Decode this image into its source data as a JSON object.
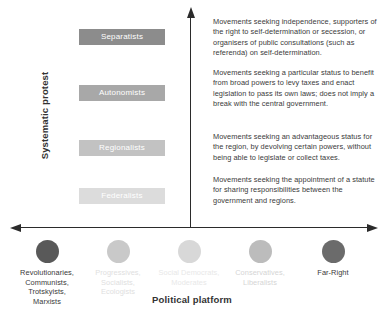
{
  "axes": {
    "y_title": "Systematic protest",
    "x_title": "Political platform"
  },
  "colors": {
    "axis": "#2b2b2b",
    "text": "#3a3a3a",
    "pill_separatists": "#8c8c8c",
    "pill_autonomists": "#a8a8a8",
    "pill_regionalists": "#c2c2c2",
    "pill_federalists": "#dcdcdc",
    "dot_revolutionaries": "#595959",
    "dot_progressives": "#c9c9c9",
    "dot_social_democrats": "#d8d8d8",
    "dot_conservatives": "#bcbcbc",
    "dot_far_right": "#6b6b6b"
  },
  "categories": [
    {
      "id": "separatists",
      "label": "Separatists",
      "fill": "#8c8c8c",
      "top": 29,
      "description": "Movements seeking independence, supporters of the right to self-determination or secession, or organisers of public consultations (such as referenda) on self-determination.",
      "desc_top": 17
    },
    {
      "id": "autonomists",
      "label": "Autonomists",
      "fill": "#a8a8a8",
      "top": 85,
      "description": "Movements seeking a particular status to benefit from broad powers to levy taxes and enact legislation to pass its own laws; does not imply a break with the central government.",
      "desc_top": 68
    },
    {
      "id": "regionalists",
      "label": "Regionalists",
      "fill": "#c2c2c2",
      "top": 140,
      "description": "Movements seeking an advantageous status for the region, by devolving certain powers, without being able to legislate or collect taxes.",
      "desc_top": 132
    },
    {
      "id": "federalists",
      "label": "Federalists",
      "fill": "#dcdcdc",
      "top": 188,
      "description": "Movements seeking the appointment of a statute for sharing responsibilities between the government and regions.",
      "desc_top": 175
    }
  ],
  "platforms": [
    {
      "id": "revolutionaries",
      "label": "Revolutionaries,\nCommunists,\nTrotskyists,\nMarxists",
      "dot_fill": "#595959",
      "text_color": "#3a3a3a",
      "left": 4
    },
    {
      "id": "progressives",
      "label": "Progressives,\nSocialists,\nEcologists",
      "dot_fill": "#c9c9c9",
      "text_color": "#e0e0e0",
      "left": 75
    },
    {
      "id": "social-democrats",
      "label": "Social Democrats,\nModerates",
      "dot_fill": "#d8d8d8",
      "text_color": "#e8e8e8",
      "left": 146
    },
    {
      "id": "conservatives",
      "label": "Conservatives,\nLiberalists",
      "dot_fill": "#bcbcbc",
      "text_color": "#d5d5d5",
      "left": 217
    },
    {
      "id": "far-right",
      "label": "Far-Right",
      "dot_fill": "#6b6b6b",
      "text_color": "#3a3a3a",
      "left": 290
    }
  ]
}
